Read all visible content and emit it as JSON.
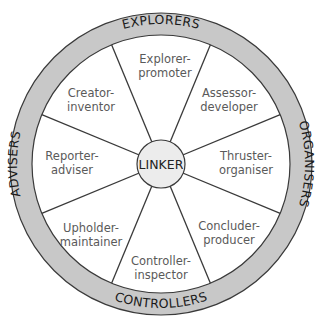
{
  "diagram": {
    "type": "team-management-wheel",
    "center": {
      "label": "LINKER"
    },
    "ring_sections": [
      {
        "id": "explorers",
        "label": "EXPLORERS",
        "position": "top"
      },
      {
        "id": "organisers",
        "label": "ORGANISERS",
        "position": "right"
      },
      {
        "id": "controllers",
        "label": "CONTROLLERS",
        "position": "bottom"
      },
      {
        "id": "advisers",
        "label": "ADVISERS",
        "position": "left"
      }
    ],
    "roles": [
      {
        "line1": "Explorer-",
        "line2": "promoter",
        "position": "top"
      },
      {
        "line1": "Assessor-",
        "line2": "developer",
        "position": "top-right"
      },
      {
        "line1": "Thruster-",
        "line2": "organiser",
        "position": "right"
      },
      {
        "line1": "Concluder-",
        "line2": "producer",
        "position": "bottom-right"
      },
      {
        "line1": "Controller-",
        "line2": "inspector",
        "position": "bottom"
      },
      {
        "line1": "Upholder-",
        "line2": "maintainer",
        "position": "bottom-left"
      },
      {
        "line1": "Reporter-",
        "line2": "adviser",
        "position": "left"
      },
      {
        "line1": "Creator-",
        "line2": "inventor",
        "position": "top-left"
      }
    ],
    "colors": {
      "ring_fill": "#c8c8c8",
      "ring_stroke": "#3a3a3a",
      "center_fill": "#ececec",
      "spoke": "#3a3a3a",
      "role_text": "#5a5a5a"
    }
  }
}
